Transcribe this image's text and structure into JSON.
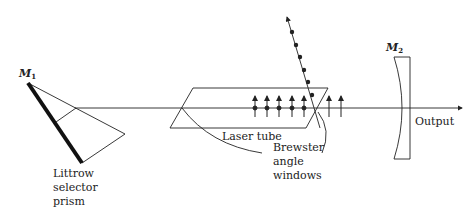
{
  "diagram": {
    "labels": {
      "mirror1": "M",
      "mirror1_sub": "1",
      "mirror2": "M",
      "mirror2_sub": "2",
      "prism_line1": "Littrow",
      "prism_line2": "selector",
      "prism_line3": "prism",
      "laser_tube": "Laser tube",
      "brewster_line1": "Brewster",
      "brewster_line2": "angle",
      "brewster_line3": "windows",
      "output": "Output"
    },
    "polarization": {
      "vertical_arrows_count": 7,
      "reflected_dots_count": 6
    },
    "colors": {
      "stroke": "#222222",
      "background": "#ffffff"
    }
  }
}
